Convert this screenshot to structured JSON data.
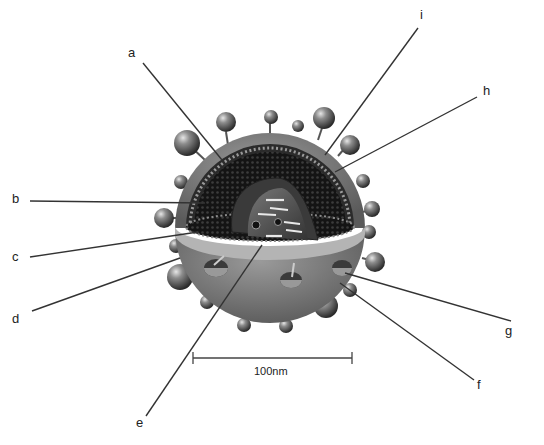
{
  "diagram": {
    "labels": [
      {
        "id": "a",
        "text": "a",
        "x": 128,
        "y": 46,
        "line": [
          143,
          63,
          222,
          160
        ]
      },
      {
        "id": "b",
        "text": "b",
        "x": 12,
        "y": 192,
        "line": [
          30,
          201,
          205,
          203
        ]
      },
      {
        "id": "c",
        "text": "c",
        "x": 12,
        "y": 250,
        "line": [
          30,
          257,
          198,
          232
        ]
      },
      {
        "id": "d",
        "text": "d",
        "x": 12,
        "y": 312,
        "line": [
          32,
          311,
          180,
          258
        ]
      },
      {
        "id": "e",
        "text": "e",
        "x": 136,
        "y": 416,
        "line": [
          146,
          416,
          262,
          245
        ]
      },
      {
        "id": "f",
        "text": "f",
        "x": 477,
        "y": 378,
        "line": [
          474,
          380,
          340,
          283
        ]
      },
      {
        "id": "g",
        "text": "g",
        "x": 505,
        "y": 324,
        "line": [
          511,
          321,
          345,
          273
        ]
      },
      {
        "id": "h",
        "text": "h",
        "x": 483,
        "y": 84,
        "line": [
          477,
          97,
          335,
          172
        ]
      },
      {
        "id": "i",
        "text": "i",
        "x": 420,
        "y": 8,
        "line": [
          418,
          28,
          325,
          155
        ]
      }
    ],
    "scale_bar": {
      "label": "100nm",
      "x1": 193,
      "x2": 352,
      "y": 358
    }
  },
  "colors": {
    "background": "#ffffff",
    "envelope": "#7a7a7a",
    "envelope_light": "#a8a8a8",
    "interior": "#1a1a1a",
    "core": "#555555",
    "line": "#333333",
    "text": "#222222"
  }
}
